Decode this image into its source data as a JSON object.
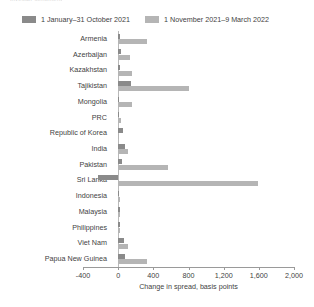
{
  "figure": {
    "clipped_title": "investor sentiment",
    "axis_title": "Change in spread, basis points"
  },
  "legend": {
    "items": [
      {
        "label": "1 January–31 October 2021",
        "color": "#8a8a8a"
      },
      {
        "label": "1 November 2021–9 March 2022",
        "color": "#b5b5b5"
      }
    ]
  },
  "chart_data": {
    "type": "bar",
    "orientation": "horizontal",
    "title": "",
    "xlabel": "Change in spread, basis points",
    "ylabel": "",
    "xlim": [
      -400,
      2000
    ],
    "xticks": [
      -400,
      0,
      400,
      800,
      1200,
      1600,
      2000
    ],
    "xtick_labels": [
      "-400",
      "0",
      "400",
      "800",
      "1,200",
      "1,600",
      "2,000"
    ],
    "grid": false,
    "legend_position": "top",
    "categories": [
      "Armenia",
      "Azerbaijan",
      "Kazakhstan",
      "Tajikistan",
      "Mongolia",
      "PRC",
      "Republic of Korea",
      "India",
      "Pakistan",
      "Sri Lanka",
      "Indonesia",
      "Malaysia",
      "Philippines",
      "Viet Nam",
      "Papua New Guinea"
    ],
    "series": [
      {
        "name": "1 January–31 October 2021",
        "color": "#8a8a8a",
        "values": [
          20,
          35,
          20,
          150,
          10,
          12,
          55,
          80,
          45,
          -230,
          12,
          18,
          20,
          70,
          75
        ]
      },
      {
        "name": "1 November 2021–9 March 2022",
        "color": "#b5b5b5",
        "values": [
          330,
          135,
          155,
          810,
          155,
          30,
          15,
          115,
          570,
          1590,
          20,
          25,
          25,
          110,
          330
        ]
      }
    ]
  }
}
